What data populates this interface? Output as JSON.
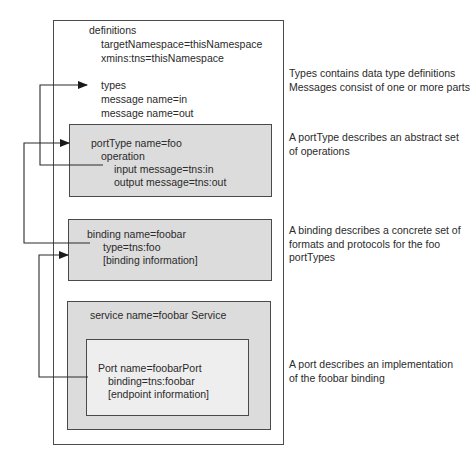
{
  "diagram": {
    "definitions": {
      "title": "definitions",
      "lines": [
        "targetNamespace=thisNamespace",
        "xmins:tns=thisNamespace"
      ],
      "types": "types",
      "messages": [
        "message name=in",
        "message name=out"
      ]
    },
    "portType": {
      "title": "portType name=foo",
      "operation": "operation",
      "input": "input message=tns:in",
      "output": "output message=tns:out"
    },
    "binding": {
      "title": "binding name=foobar",
      "type": "type=tns:foo",
      "info": "[binding information]"
    },
    "service": {
      "title": "service name=foobar Service",
      "port": {
        "title": "Port name=foobarPort",
        "binding": "binding=tns:foobar",
        "info": "[endpoint information]"
      }
    }
  },
  "annotations": {
    "types": [
      "Types contains data type definitions",
      "Messages consist of one or more parts"
    ],
    "portType": [
      "A portType describes an abstract set",
      "of operations"
    ],
    "binding": [
      "A binding describes a concrete set of",
      "formats and protocols for the foo",
      "portTypes"
    ],
    "port": [
      "A port describes an implementation",
      "of the foobar binding"
    ]
  },
  "colors": {
    "line": "#2a2a2a",
    "box_fill": "#dcdcdc",
    "port_fill": "#eeeeee",
    "border": "#4a4a4a"
  }
}
